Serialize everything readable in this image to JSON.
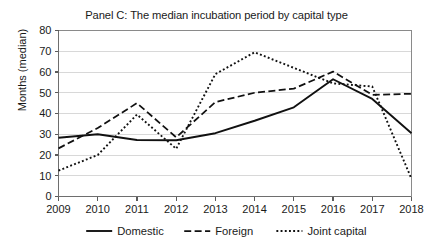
{
  "chart_data": {
    "type": "line",
    "title": "Panel C: The median incubation period by capital type",
    "xlabel": "",
    "ylabel": "Months (median)",
    "categories": [
      "2009",
      "2010",
      "2011",
      "2012",
      "2013",
      "2014",
      "2015",
      "2016",
      "2017",
      "2018"
    ],
    "x": [
      2009,
      2010,
      2011,
      2012,
      2013,
      2014,
      2015,
      2016,
      2017,
      2018
    ],
    "ylim": [
      0,
      80
    ],
    "yticks": [
      0,
      10,
      20,
      30,
      40,
      50,
      60,
      70,
      80
    ],
    "ytick_labels": [
      "0",
      "10",
      "20",
      "30",
      "40",
      "50",
      "60",
      "70",
      "80"
    ],
    "grid": true,
    "legend_position": "bottom",
    "series": [
      {
        "name": "Domestic",
        "style": "solid",
        "color": "#111111",
        "values": [
          28.3,
          30.0,
          27.2,
          27.1,
          30.5,
          36.5,
          43.0,
          56.5,
          47.0,
          30.5
        ]
      },
      {
        "name": "Foreign",
        "style": "dashed",
        "color": "#111111",
        "values": [
          23.2,
          33.0,
          45.0,
          28.5,
          45.5,
          50.0,
          52.0,
          60.2,
          49.0,
          49.5
        ]
      },
      {
        "name": "Joint capital",
        "style": "dotted",
        "color": "#111111",
        "values": [
          12.5,
          20.0,
          39.5,
          23.0,
          59.0,
          69.5,
          62.0,
          54.5,
          53.0,
          8.5
        ]
      }
    ]
  },
  "legend": {
    "items": [
      {
        "label": "Domestic",
        "style": "solid"
      },
      {
        "label": "Foreign",
        "style": "dashed"
      },
      {
        "label": "Joint capital",
        "style": "dotted"
      }
    ]
  },
  "colors": {
    "series": "#111111",
    "gridline": "#d8d8d8",
    "axis": "#6e6e6e",
    "background": "#ffffff"
  }
}
